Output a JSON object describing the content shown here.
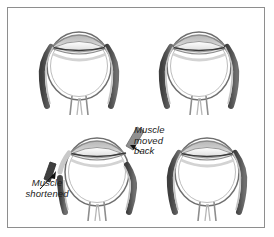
{
  "figure": {
    "border_color": "#8e8e8e",
    "background_color": "#ffffff"
  },
  "palette": {
    "muscle_dark": "#4d4d4d",
    "muscle_mid": "#6e6e6e",
    "sclera_line": "#7a7a7a",
    "sclera_fill": "#ffffff",
    "cornea_shade": "#c9c9c9",
    "lens_shade": "#e3e3e3",
    "outline": "#5c5c5c",
    "text": "#1b1b1b",
    "arrow": "#111111"
  },
  "panels": [
    {
      "id": "top-left",
      "name": "pre-operative-eye-left",
      "caption": "",
      "state": "intact muscles attached"
    },
    {
      "id": "top-right",
      "name": "pre-operative-eye-right",
      "caption": "",
      "state": "intact muscles attached"
    },
    {
      "id": "bottom-left",
      "name": "post-operative-eye-left",
      "caption": "",
      "state": "medial muscle shortened, lateral muscle recessed"
    },
    {
      "id": "bottom-right",
      "name": "post-operative-eye-right",
      "caption": "",
      "state": "intact muscles attached"
    }
  ],
  "annotations": {
    "moved_back": {
      "lines": [
        "Muscle",
        "moved",
        "back"
      ],
      "line1": "Muscle",
      "line2": "moved",
      "line3": "back"
    },
    "shortened": {
      "lines": [
        "Muscle",
        "shortened"
      ],
      "line1": "Muscle",
      "line2": "shortened"
    }
  },
  "icons": {
    "pointer_moved_back": "arrow-icon",
    "pointer_shortened": "arrow-icon",
    "excised_segment": "muscle-segment-icon",
    "recessed_segment": "muscle-segment-icon"
  }
}
